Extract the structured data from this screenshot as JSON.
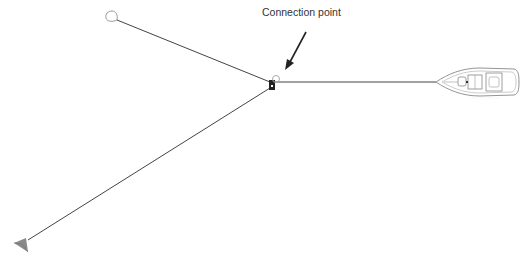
{
  "diagram": {
    "label": "Connection point",
    "colors": {
      "line": "#333333",
      "outline": "#999999",
      "anchor_fill": "#888888",
      "junction": "#222222"
    },
    "nodes": [
      {
        "id": "buoy",
        "name": "Buoy",
        "x": 110,
        "y": 18
      },
      {
        "id": "connection",
        "name": "Connection point",
        "x": 272,
        "y": 84
      },
      {
        "id": "boat",
        "name": "Boat",
        "x": 478,
        "y": 82
      },
      {
        "id": "anchor",
        "name": "Anchor",
        "x": 18,
        "y": 246
      }
    ],
    "edges": [
      {
        "from": "buoy",
        "to": "connection"
      },
      {
        "from": "connection",
        "to": "boat"
      },
      {
        "from": "connection",
        "to": "anchor"
      }
    ]
  }
}
